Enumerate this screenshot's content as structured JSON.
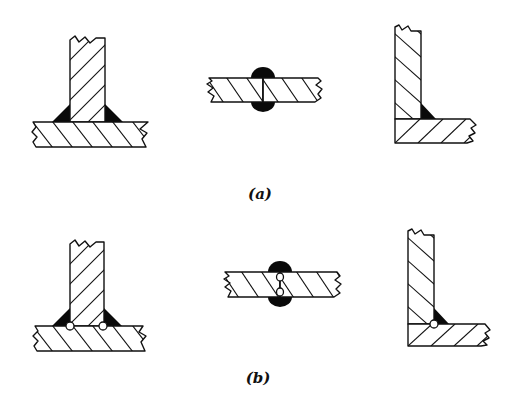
{
  "figure": {
    "rows": [
      {
        "caption": "(a)",
        "description": "Fillet and butt welds without defects",
        "joints": [
          {
            "type": "T-joint",
            "welds": "two fillet welds"
          },
          {
            "type": "butt joint",
            "welds": "double-sided bead"
          },
          {
            "type": "corner joint",
            "welds": "one inside fillet weld"
          }
        ]
      },
      {
        "caption": "(b)",
        "description": "Same joints showing incomplete penetration voids at weld roots",
        "joints": [
          {
            "type": "T-joint",
            "welds": "two fillet welds",
            "voids": 2
          },
          {
            "type": "butt joint",
            "welds": "double-sided bead",
            "voids": 2
          },
          {
            "type": "corner joint",
            "welds": "one inside fillet weld",
            "voids": 1
          }
        ]
      }
    ],
    "colors": {
      "line": "#111111",
      "weld": "#0a0a0a",
      "background": "#ffffff"
    }
  }
}
